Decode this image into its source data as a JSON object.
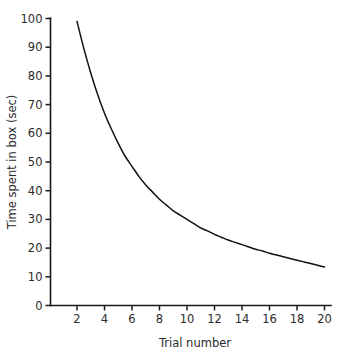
{
  "chart_data": {
    "type": "line",
    "title": "",
    "subtitle": "",
    "xlabel": "Trial number",
    "ylabel": "Time spent in box (sec)",
    "xlim": [
      0,
      20.6
    ],
    "ylim": [
      0,
      100
    ],
    "grid": false,
    "legend": null,
    "legend_position": "none",
    "annotations": [],
    "xticks": [
      2,
      4,
      6,
      8,
      10,
      12,
      14,
      16,
      18,
      20
    ],
    "xtick_labels": [
      "2",
      "4",
      "6",
      "8",
      "10",
      "12",
      "14",
      "16",
      "18",
      "20"
    ],
    "yticks": [
      0,
      10,
      20,
      30,
      40,
      50,
      60,
      70,
      80,
      90,
      100
    ],
    "ytick_labels": [
      "0",
      "10",
      "20",
      "30",
      "40",
      "50",
      "60",
      "70",
      "80",
      "90",
      "100"
    ],
    "series": [
      {
        "name": "Time spent in box",
        "color": "#111111",
        "x": [
          2,
          2.5,
          3,
          3.5,
          4,
          4.5,
          5,
          5.5,
          6,
          6.5,
          7,
          7.5,
          8,
          8.5,
          9,
          9.5,
          10,
          10.5,
          11,
          11.5,
          12,
          12.5,
          13,
          13.5,
          14,
          14.5,
          15,
          15.5,
          16,
          16.5,
          17,
          17.5,
          18,
          18.5,
          19,
          19.5,
          20
        ],
        "values": [
          99,
          89.5,
          81,
          73.5,
          67,
          61.5,
          56.5,
          52,
          48.5,
          45,
          42,
          39.5,
          37,
          35,
          33,
          31.5,
          30,
          28.5,
          27,
          26,
          24.8,
          23.8,
          22.8,
          22,
          21.2,
          20.4,
          19.6,
          19,
          18.2,
          17.6,
          17,
          16.4,
          15.8,
          15.2,
          14.6,
          14,
          13.4
        ]
      }
    ]
  },
  "figure": {
    "background_color": "#ffffff",
    "axis_color": "#1a1a1a",
    "text_color": "#2b2b2b",
    "curve_color": "#111111"
  }
}
